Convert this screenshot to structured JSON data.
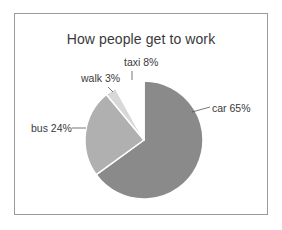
{
  "chart_data": {
    "type": "pie",
    "title": "How people get to work",
    "categories": [
      "car",
      "bus",
      "walk",
      "taxi"
    ],
    "values": [
      65,
      24,
      3,
      8
    ],
    "unit": "%",
    "labels": [
      "car 65%",
      "bus 24%",
      "walk 3%",
      "taxi 8%"
    ],
    "colors": [
      "#8a8a8a",
      "#b0b0b0",
      "#d8d8d8",
      "#ffffff"
    ],
    "start_angle_deg": 0,
    "direction": "clockwise",
    "legend": "none",
    "data_labels": "outside with leader lines"
  }
}
